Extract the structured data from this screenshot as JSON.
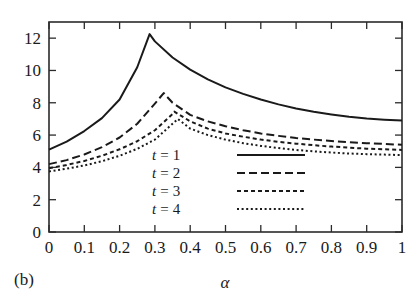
{
  "figure": {
    "panel_label": "(b)",
    "background_color": "#ffffff",
    "line_color": "#1a1a1a"
  },
  "chart_data": {
    "type": "line",
    "title": "",
    "xlabel": "α",
    "ylabel": "",
    "xlim": [
      0,
      1
    ],
    "ylim": [
      0,
      13
    ],
    "grid": false,
    "legend_position": "center",
    "xticks": [
      0,
      0.1,
      0.2,
      0.3,
      0.4,
      0.5,
      0.6,
      0.7,
      0.8,
      0.9,
      1
    ],
    "xtick_labels": [
      "0",
      "0.1",
      "0.2",
      "0.3",
      "0.4",
      "0.5",
      "0.6",
      "0.7",
      "0.8",
      "0.9",
      "1"
    ],
    "yticks": [
      0,
      2,
      4,
      6,
      8,
      10,
      12
    ],
    "ytick_labels": [
      "0",
      "2",
      "4",
      "6",
      "8",
      "10",
      "12"
    ],
    "series": [
      {
        "name": "t = 1",
        "label_var": "t",
        "label_eq": "=",
        "label_val": "1",
        "dash": "none",
        "stroke_width": 2.0,
        "peak_x": 0.285,
        "peak_y": 12.25,
        "x": [
          0.0,
          0.05,
          0.1,
          0.15,
          0.2,
          0.25,
          0.285,
          0.3,
          0.35,
          0.4,
          0.45,
          0.5,
          0.55,
          0.6,
          0.65,
          0.7,
          0.75,
          0.8,
          0.85,
          0.9,
          0.95,
          1.0
        ],
        "y": [
          5.1,
          5.6,
          6.25,
          7.05,
          8.2,
          10.2,
          12.25,
          11.8,
          10.8,
          10.05,
          9.45,
          8.95,
          8.55,
          8.2,
          7.9,
          7.65,
          7.45,
          7.28,
          7.13,
          7.02,
          6.95,
          6.9
        ]
      },
      {
        "name": "t = 2",
        "label_var": "t",
        "label_eq": "=",
        "label_val": "2",
        "dash": "8,4",
        "stroke_width": 2.0,
        "peak_x": 0.325,
        "peak_y": 8.6,
        "x": [
          0.0,
          0.05,
          0.1,
          0.15,
          0.2,
          0.25,
          0.3,
          0.325,
          0.35,
          0.4,
          0.45,
          0.5,
          0.55,
          0.6,
          0.65,
          0.7,
          0.75,
          0.8,
          0.85,
          0.9,
          0.95,
          1.0
        ],
        "y": [
          4.2,
          4.45,
          4.8,
          5.25,
          5.85,
          6.7,
          7.95,
          8.6,
          8.0,
          7.25,
          6.85,
          6.55,
          6.3,
          6.1,
          5.95,
          5.82,
          5.72,
          5.63,
          5.56,
          5.5,
          5.45,
          5.4
        ]
      },
      {
        "name": "t = 3",
        "label_var": "t",
        "label_eq": "=",
        "label_val": "3",
        "dash": "4,3",
        "stroke_width": 2.0,
        "peak_x": 0.355,
        "peak_y": 7.45,
        "x": [
          0.0,
          0.05,
          0.1,
          0.15,
          0.2,
          0.25,
          0.3,
          0.35,
          0.355,
          0.4,
          0.45,
          0.5,
          0.55,
          0.6,
          0.65,
          0.7,
          0.75,
          0.8,
          0.85,
          0.9,
          0.95,
          1.0
        ],
        "y": [
          3.95,
          4.15,
          4.4,
          4.72,
          5.12,
          5.62,
          6.3,
          7.3,
          7.45,
          6.85,
          6.4,
          6.1,
          5.9,
          5.72,
          5.58,
          5.47,
          5.37,
          5.29,
          5.22,
          5.16,
          5.12,
          5.08
        ]
      },
      {
        "name": "t = 4",
        "label_var": "t",
        "label_eq": "=",
        "label_val": "4",
        "dash": "2,2.6",
        "stroke_width": 2.0,
        "peak_x": 0.365,
        "peak_y": 7.0,
        "x": [
          0.0,
          0.05,
          0.1,
          0.15,
          0.2,
          0.25,
          0.3,
          0.35,
          0.365,
          0.4,
          0.45,
          0.5,
          0.55,
          0.6,
          0.65,
          0.7,
          0.75,
          0.8,
          0.85,
          0.9,
          0.95,
          1.0
        ],
        "y": [
          3.75,
          3.92,
          4.12,
          4.38,
          4.72,
          5.15,
          5.72,
          6.7,
          7.0,
          6.4,
          6.0,
          5.72,
          5.5,
          5.33,
          5.2,
          5.08,
          4.99,
          4.92,
          4.86,
          4.82,
          4.79,
          4.76
        ]
      }
    ]
  }
}
